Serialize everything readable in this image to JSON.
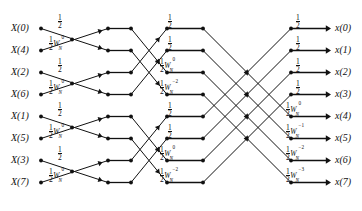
{
  "diagram": {
    "node_color": "#111111",
    "line_color": "#111111",
    "rows": 8,
    "stages": 3,
    "inputs": [
      {
        "label": "X(0)",
        "row": 0
      },
      {
        "label": "X(4)",
        "row": 1
      },
      {
        "label": "X(2)",
        "row": 2
      },
      {
        "label": "X(6)",
        "row": 3
      },
      {
        "label": "X(1)",
        "row": 4
      },
      {
        "label": "X(5)",
        "row": 5
      },
      {
        "label": "X(3)",
        "row": 6
      },
      {
        "label": "X(7)",
        "row": 7
      }
    ],
    "outputs": [
      {
        "label": "x(0)",
        "row": 0
      },
      {
        "label": "x(1)",
        "row": 1
      },
      {
        "label": "x(2)",
        "row": 2
      },
      {
        "label": "x(3)",
        "row": 3
      },
      {
        "label": "x(4)",
        "row": 4
      },
      {
        "label": "x(5)",
        "row": 5
      },
      {
        "label": "x(6)",
        "row": 6
      },
      {
        "label": "x(7)",
        "row": 7
      }
    ],
    "stage1_labels": [
      {
        "row": 0,
        "num": "1",
        "den": "2",
        "w": false,
        "exp": ""
      },
      {
        "row": 1,
        "num": "1",
        "den": "2",
        "w": true,
        "exp": "0"
      },
      {
        "row": 2,
        "num": "1",
        "den": "2",
        "w": false,
        "exp": ""
      },
      {
        "row": 3,
        "num": "1",
        "den": "2",
        "w": true,
        "exp": "0"
      },
      {
        "row": 4,
        "num": "1",
        "den": "2",
        "w": false,
        "exp": ""
      },
      {
        "row": 5,
        "num": "1",
        "den": "2",
        "w": true,
        "exp": "0"
      },
      {
        "row": 6,
        "num": "1",
        "den": "2",
        "w": false,
        "exp": ""
      },
      {
        "row": 7,
        "num": "1",
        "den": "2",
        "w": true,
        "exp": "0"
      }
    ],
    "stage2_labels": [
      {
        "row": 0,
        "num": "1",
        "den": "2",
        "w": false,
        "exp": ""
      },
      {
        "row": 1,
        "num": "1",
        "den": "2",
        "w": false,
        "exp": ""
      },
      {
        "row": 2,
        "num": "1",
        "den": "2",
        "w": true,
        "exp": "0"
      },
      {
        "row": 3,
        "num": "1",
        "den": "2",
        "w": true,
        "exp": "−2"
      },
      {
        "row": 4,
        "num": "1",
        "den": "2",
        "w": false,
        "exp": ""
      },
      {
        "row": 5,
        "num": "1",
        "den": "2",
        "w": false,
        "exp": ""
      },
      {
        "row": 6,
        "num": "1",
        "den": "2",
        "w": true,
        "exp": "0"
      },
      {
        "row": 7,
        "num": "1",
        "den": "2",
        "w": true,
        "exp": "−2"
      }
    ],
    "stage3_labels": [
      {
        "row": 0,
        "num": "1",
        "den": "2",
        "w": false,
        "exp": ""
      },
      {
        "row": 1,
        "num": "1",
        "den": "2",
        "w": false,
        "exp": ""
      },
      {
        "row": 2,
        "num": "1",
        "den": "2",
        "w": false,
        "exp": ""
      },
      {
        "row": 3,
        "num": "1",
        "den": "2",
        "w": false,
        "exp": ""
      },
      {
        "row": 4,
        "num": "1",
        "den": "2",
        "w": true,
        "exp": "0"
      },
      {
        "row": 5,
        "num": "1",
        "den": "2",
        "w": true,
        "exp": "−1"
      },
      {
        "row": 6,
        "num": "1",
        "den": "2",
        "w": true,
        "exp": "−2"
      },
      {
        "row": 7,
        "num": "1",
        "den": "2",
        "w": true,
        "exp": "−3"
      }
    ],
    "twiddle_base": "W",
    "twiddle_sub": "N"
  }
}
